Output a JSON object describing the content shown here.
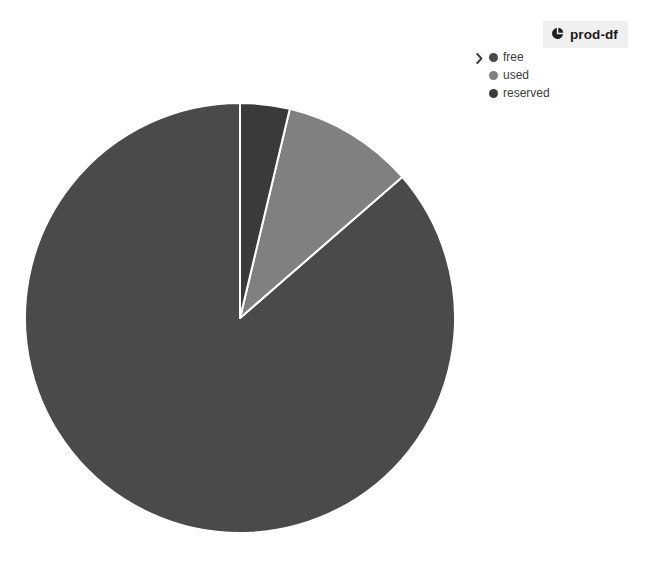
{
  "header": {
    "title": "prod-df",
    "icon": "pie-chart-icon",
    "chip_background": "#f0f0f0"
  },
  "legend": {
    "expander_icon": "chevron-right-icon",
    "position": "top-right",
    "items": [
      {
        "label": "free",
        "color": "#4a4a4a"
      },
      {
        "label": "used",
        "color": "#808080"
      },
      {
        "label": "reserved",
        "color": "#3a3a3a"
      }
    ]
  },
  "chart_data": {
    "type": "pie",
    "title": "prod-df",
    "xlabel": "",
    "ylabel": "",
    "labels": [
      "free",
      "used",
      "reserved"
    ],
    "values": [
      86.4,
      9.9,
      3.7
    ],
    "colors": [
      "#4a4a4a",
      "#808080",
      "#3a3a3a"
    ],
    "start_angle_deg": 0,
    "direction": "counterclockwise",
    "slice_angles_deg": [
      311.0,
      35.6,
      13.4
    ],
    "slice_border_color": "#ffffff",
    "slice_border_width": 2,
    "legend": [
      "free",
      "used",
      "reserved"
    ],
    "legend_position": "top-right",
    "grid": false,
    "center_px": [
      240,
      318
    ],
    "radius_px": 215
  },
  "canvas": {
    "width": 648,
    "height": 564,
    "background": "#ffffff"
  }
}
